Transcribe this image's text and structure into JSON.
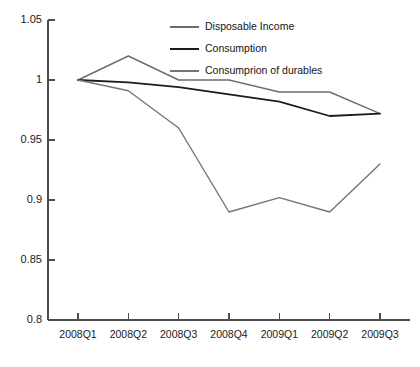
{
  "chart_data": {
    "type": "line",
    "title": "",
    "xlabel": "",
    "ylabel": "",
    "categories": [
      "2008Q1",
      "2008Q2",
      "2008Q3",
      "2008Q4",
      "2009Q1",
      "2009Q2",
      "2009Q3"
    ],
    "ylim": [
      0.8,
      1.05
    ],
    "yticks": [
      "1.05",
      "1",
      "0.95",
      "0.9",
      "0.85",
      "0.8"
    ],
    "ytick_values": [
      1.05,
      1.0,
      0.95,
      0.9,
      0.85,
      0.8
    ],
    "grid": false,
    "legend_position": "top-center-inside",
    "series": [
      {
        "name": "Disposable Income",
        "color": "#6e6e6e",
        "values": [
          1.0,
          1.02,
          1.0,
          1.0,
          0.99,
          0.99,
          0.972
        ]
      },
      {
        "name": "Consumption",
        "color": "#1c1c1c",
        "values": [
          1.0,
          0.998,
          0.994,
          0.988,
          0.982,
          0.97,
          0.972
        ]
      },
      {
        "name": "Consumprion of durables",
        "color": "#757575",
        "values": [
          1.0,
          0.991,
          0.96,
          0.89,
          0.902,
          0.89,
          0.93
        ]
      }
    ]
  },
  "axis": {
    "line_color": "#4d4d4d"
  }
}
